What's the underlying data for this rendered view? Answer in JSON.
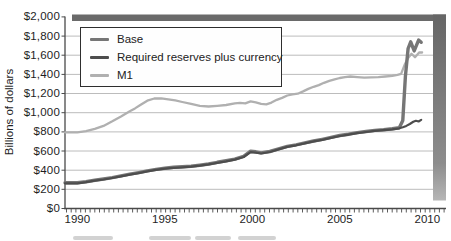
{
  "chart_data": {
    "type": "line",
    "title": "",
    "xlabel": "",
    "ylabel": "Billions of dollars",
    "xlim": [
      1990,
      2010.3
    ],
    "ylim": [
      0,
      2000
    ],
    "grid": "horizontal",
    "legend_position": "top-left",
    "x_ticks": [
      1990,
      1995,
      2000,
      2005,
      2010
    ],
    "x_tick_labels": [
      "1990",
      "1995",
      "2000",
      "2005",
      "2010"
    ],
    "minor_x_ticks": "quarterly",
    "y_ticks": [
      0,
      200,
      400,
      600,
      800,
      1000,
      1200,
      1400,
      1600,
      1800,
      2000
    ],
    "y_tick_labels": [
      "$0",
      "$200",
      "$400",
      "$600",
      "$800",
      "$1,000",
      "$1,200",
      "$1,400",
      "$1,600",
      "$1,800",
      "$2,000"
    ],
    "colors": {
      "background": "#ffffff",
      "grid": "#bcbcbc",
      "axis": "#4a4a4a",
      "shadow_band": "#6a6a6a",
      "legend_border": "#2e2e2e"
    },
    "series": [
      {
        "id": "base",
        "name": "Base",
        "color": "#767676",
        "width": 3.4,
        "points": [
          [
            1990.0,
            268
          ],
          [
            1990.5,
            280
          ],
          [
            1991.0,
            295
          ],
          [
            1991.5,
            308
          ],
          [
            1992.0,
            323
          ],
          [
            1992.5,
            340
          ],
          [
            1993.0,
            358
          ],
          [
            1993.5,
            375
          ],
          [
            1994.0,
            393
          ],
          [
            1994.5,
            408
          ],
          [
            1995.0,
            420
          ],
          [
            1995.5,
            430
          ],
          [
            1996.0,
            435
          ],
          [
            1996.5,
            442
          ],
          [
            1997.0,
            452
          ],
          [
            1997.5,
            465
          ],
          [
            1998.0,
            482
          ],
          [
            1998.5,
            498
          ],
          [
            1999.0,
            515
          ],
          [
            1999.5,
            545
          ],
          [
            1999.9,
            598
          ],
          [
            2000.2,
            592
          ],
          [
            2000.5,
            580
          ],
          [
            2001.0,
            595
          ],
          [
            2001.5,
            622
          ],
          [
            2002.0,
            648
          ],
          [
            2002.5,
            665
          ],
          [
            2003.0,
            685
          ],
          [
            2003.5,
            705
          ],
          [
            2004.0,
            722
          ],
          [
            2004.5,
            742
          ],
          [
            2005.0,
            762
          ],
          [
            2005.5,
            776
          ],
          [
            2006.0,
            792
          ],
          [
            2006.5,
            804
          ],
          [
            2007.0,
            815
          ],
          [
            2007.5,
            823
          ],
          [
            2008.0,
            832
          ],
          [
            2008.4,
            842
          ],
          [
            2008.6,
            920
          ],
          [
            2008.75,
            1380
          ],
          [
            2008.9,
            1670
          ],
          [
            2009.05,
            1740
          ],
          [
            2009.25,
            1645
          ],
          [
            2009.5,
            1758
          ],
          [
            2009.65,
            1735
          ]
        ]
      },
      {
        "id": "required-reserves-plus-currency",
        "name": "Required reserves plus currency",
        "color": "#4d4d4d",
        "width": 2.2,
        "points": [
          [
            1990.0,
            263
          ],
          [
            1990.5,
            275
          ],
          [
            1991.0,
            290
          ],
          [
            1991.5,
            303
          ],
          [
            1992.0,
            318
          ],
          [
            1992.5,
            335
          ],
          [
            1993.0,
            353
          ],
          [
            1993.5,
            370
          ],
          [
            1994.0,
            388
          ],
          [
            1994.5,
            403
          ],
          [
            1995.0,
            415
          ],
          [
            1995.5,
            425
          ],
          [
            1996.0,
            430
          ],
          [
            1996.5,
            437
          ],
          [
            1997.0,
            447
          ],
          [
            1997.5,
            460
          ],
          [
            1998.0,
            477
          ],
          [
            1998.5,
            493
          ],
          [
            1999.0,
            510
          ],
          [
            1999.5,
            538
          ],
          [
            1999.9,
            588
          ],
          [
            2000.2,
            584
          ],
          [
            2000.5,
            574
          ],
          [
            2001.0,
            590
          ],
          [
            2001.5,
            617
          ],
          [
            2002.0,
            643
          ],
          [
            2002.5,
            660
          ],
          [
            2003.0,
            680
          ],
          [
            2003.5,
            700
          ],
          [
            2004.0,
            717
          ],
          [
            2004.5,
            737
          ],
          [
            2005.0,
            757
          ],
          [
            2005.5,
            771
          ],
          [
            2006.0,
            787
          ],
          [
            2006.5,
            799
          ],
          [
            2007.0,
            810
          ],
          [
            2007.5,
            818
          ],
          [
            2008.0,
            827
          ],
          [
            2008.4,
            837
          ],
          [
            2008.6,
            848
          ],
          [
            2008.8,
            862
          ],
          [
            2009.0,
            882
          ],
          [
            2009.2,
            905
          ],
          [
            2009.35,
            915
          ],
          [
            2009.5,
            908
          ],
          [
            2009.65,
            925
          ]
        ]
      },
      {
        "id": "m1",
        "name": "M1",
        "color": "#b0b0b0",
        "width": 2.3,
        "points": [
          [
            1990.0,
            795
          ],
          [
            1990.5,
            808
          ],
          [
            1991.0,
            832
          ],
          [
            1991.5,
            862
          ],
          [
            1992.0,
            910
          ],
          [
            1992.5,
            960
          ],
          [
            1993.0,
            1015
          ],
          [
            1993.3,
            1045
          ],
          [
            1993.6,
            1080
          ],
          [
            1994.0,
            1125
          ],
          [
            1994.4,
            1148
          ],
          [
            1994.8,
            1150
          ],
          [
            1995.2,
            1140
          ],
          [
            1995.6,
            1128
          ],
          [
            1996.0,
            1112
          ],
          [
            1996.5,
            1092
          ],
          [
            1997.0,
            1072
          ],
          [
            1997.5,
            1065
          ],
          [
            1998.0,
            1072
          ],
          [
            1998.5,
            1080
          ],
          [
            1999.0,
            1098
          ],
          [
            1999.3,
            1102
          ],
          [
            1999.6,
            1098
          ],
          [
            1999.9,
            1118
          ],
          [
            2000.2,
            1108
          ],
          [
            2000.5,
            1092
          ],
          [
            2000.8,
            1088
          ],
          [
            2001.1,
            1105
          ],
          [
            2001.4,
            1135
          ],
          [
            2001.7,
            1155
          ],
          [
            2002.0,
            1180
          ],
          [
            2002.3,
            1192
          ],
          [
            2002.6,
            1198
          ],
          [
            2002.9,
            1222
          ],
          [
            2003.2,
            1248
          ],
          [
            2003.5,
            1270
          ],
          [
            2003.8,
            1288
          ],
          [
            2004.1,
            1312
          ],
          [
            2004.4,
            1332
          ],
          [
            2004.7,
            1348
          ],
          [
            2005.0,
            1362
          ],
          [
            2005.3,
            1372
          ],
          [
            2005.6,
            1378
          ],
          [
            2006.0,
            1372
          ],
          [
            2006.4,
            1366
          ],
          [
            2006.8,
            1368
          ],
          [
            2007.2,
            1372
          ],
          [
            2007.6,
            1378
          ],
          [
            2008.0,
            1385
          ],
          [
            2008.3,
            1395
          ],
          [
            2008.5,
            1405
          ],
          [
            2008.7,
            1500
          ],
          [
            2008.9,
            1570
          ],
          [
            2009.1,
            1615
          ],
          [
            2009.3,
            1578
          ],
          [
            2009.55,
            1630
          ],
          [
            2009.7,
            1628
          ]
        ]
      }
    ]
  }
}
